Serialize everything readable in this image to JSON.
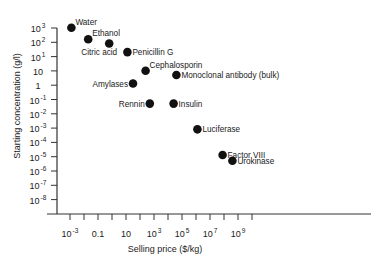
{
  "chart_data": {
    "type": "scatter",
    "title": "",
    "xlabel": "Selling price ($/kg)",
    "ylabel": "Starting concentration (g/l)",
    "xscale": "log",
    "yscale": "log",
    "grid": false,
    "legend": null,
    "x_ticks": [
      {
        "base": "10",
        "exp": "-3"
      },
      {
        "base": "0.1",
        "exp": ""
      },
      {
        "base": "10",
        "exp": ""
      },
      {
        "base": "10",
        "exp": "3"
      },
      {
        "base": "10",
        "exp": "5"
      },
      {
        "base": "10",
        "exp": "7"
      },
      {
        "base": "10",
        "exp": "9"
      }
    ],
    "x_tick_exponents": [
      -3,
      -1,
      1,
      3,
      5,
      7,
      9
    ],
    "y_ticks": [
      {
        "base": "10",
        "exp": "3"
      },
      {
        "base": "10",
        "exp": "2"
      },
      {
        "base": "10",
        "exp": "1"
      },
      {
        "base": "10",
        "exp": ""
      },
      {
        "base": "1",
        "exp": ""
      },
      {
        "base": "10",
        "exp": "-1"
      },
      {
        "base": "10",
        "exp": "-2"
      },
      {
        "base": "10",
        "exp": "-3"
      },
      {
        "base": "10",
        "exp": "-4"
      },
      {
        "base": "10",
        "exp": "-5"
      },
      {
        "base": "10",
        "exp": "-6"
      },
      {
        "base": "10",
        "exp": "-7"
      },
      {
        "base": "10",
        "exp": "-8"
      }
    ],
    "xlim_log10": [
      -3,
      10
    ],
    "ylim_log10": [
      -8,
      4
    ],
    "points": [
      {
        "label": "Water",
        "log10_price": -2.9,
        "log10_conc": 4.0,
        "label_pos": "right-up"
      },
      {
        "label": "Ethanol",
        "log10_price": -1.7,
        "log10_conc": 3.2,
        "label_pos": "right-up"
      },
      {
        "label": "Citric acid",
        "log10_price": -0.2,
        "log10_conc": 2.9,
        "label_pos": "below-left"
      },
      {
        "label": "Penicillin G",
        "log10_price": 1.1,
        "log10_conc": 2.3,
        "label_pos": "right"
      },
      {
        "label": "Cephalosporin",
        "log10_price": 2.4,
        "log10_conc": 1.0,
        "label_pos": "right-up"
      },
      {
        "label": "Monoclonal antibody (bulk)",
        "log10_price": 4.6,
        "log10_conc": 0.7,
        "label_pos": "right"
      },
      {
        "label": "Amylases",
        "log10_price": 1.5,
        "log10_conc": 0.1,
        "label_pos": "left"
      },
      {
        "label": "Rennin",
        "log10_price": 2.7,
        "log10_conc": -1.3,
        "label_pos": "left"
      },
      {
        "label": "Insulin",
        "log10_price": 4.4,
        "log10_conc": -1.3,
        "label_pos": "right"
      },
      {
        "label": "Luciferase",
        "log10_price": 6.1,
        "log10_conc": -3.1,
        "label_pos": "right"
      },
      {
        "label": "Factor VIII",
        "log10_price": 7.9,
        "log10_conc": -4.9,
        "label_pos": "right"
      },
      {
        "label": "Urokinase",
        "log10_price": 8.6,
        "log10_conc": -5.3,
        "label_pos": "right"
      }
    ],
    "marker_color": "#111111"
  }
}
